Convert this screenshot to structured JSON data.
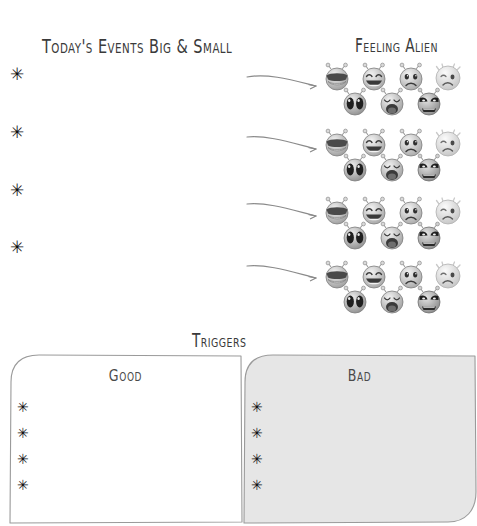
{
  "page": {
    "background_color": "#ffffff",
    "ink_color": "#2b2b2b"
  },
  "events_section": {
    "title": "Today's Events Big & Small",
    "bullet_glyph": "✳",
    "bullets": [
      {
        "marker": "✳",
        "value": ""
      },
      {
        "marker": "✳",
        "value": ""
      },
      {
        "marker": "✳",
        "value": ""
      },
      {
        "marker": "✳",
        "value": ""
      }
    ]
  },
  "alien_section": {
    "title": "Feeling alien",
    "arrow_count": 4,
    "groups": [
      {
        "label": "mood-row-1",
        "faces": [
          {
            "name": "cool-sunglasses-alien-face",
            "mood": "cool"
          },
          {
            "name": "laughing-alien-face",
            "mood": "laughing"
          },
          {
            "name": "sad-alien-face",
            "mood": "sad"
          },
          {
            "name": "sick-alien-face",
            "mood": "sick"
          },
          {
            "name": "shocked-alien-face",
            "mood": "shocked"
          },
          {
            "name": "crying-alien-face",
            "mood": "crying"
          },
          {
            "name": "angry-alien-face",
            "mood": "angry"
          }
        ]
      },
      {
        "label": "mood-row-2",
        "faces": [
          {
            "name": "cool-sunglasses-alien-face",
            "mood": "cool"
          },
          {
            "name": "laughing-alien-face",
            "mood": "laughing"
          },
          {
            "name": "sad-alien-face",
            "mood": "sad"
          },
          {
            "name": "sick-alien-face",
            "mood": "sick"
          },
          {
            "name": "shocked-alien-face",
            "mood": "shocked"
          },
          {
            "name": "crying-alien-face",
            "mood": "crying"
          },
          {
            "name": "angry-alien-face",
            "mood": "angry"
          }
        ]
      },
      {
        "label": "mood-row-3",
        "faces": [
          {
            "name": "cool-sunglasses-alien-face",
            "mood": "cool"
          },
          {
            "name": "laughing-alien-face",
            "mood": "laughing"
          },
          {
            "name": "sad-alien-face",
            "mood": "sad"
          },
          {
            "name": "sick-alien-face",
            "mood": "sick"
          },
          {
            "name": "shocked-alien-face",
            "mood": "shocked"
          },
          {
            "name": "crying-alien-face",
            "mood": "crying"
          },
          {
            "name": "angry-alien-face",
            "mood": "angry"
          }
        ]
      },
      {
        "label": "mood-row-4",
        "faces": [
          {
            "name": "cool-sunglasses-alien-face",
            "mood": "cool"
          },
          {
            "name": "laughing-alien-face",
            "mood": "laughing"
          },
          {
            "name": "sad-alien-face",
            "mood": "sad"
          },
          {
            "name": "sick-alien-face",
            "mood": "sick"
          },
          {
            "name": "shocked-alien-face",
            "mood": "shocked"
          },
          {
            "name": "crying-alien-face",
            "mood": "crying"
          },
          {
            "name": "angry-alien-face",
            "mood": "angry"
          }
        ]
      }
    ]
  },
  "triggers_section": {
    "title": "Triggers",
    "boxes": [
      {
        "label": "Good",
        "fill_color": "#ffffff",
        "border_color": "#9a9a9a",
        "bullets": [
          {
            "marker": "✳",
            "value": ""
          },
          {
            "marker": "✳",
            "value": ""
          },
          {
            "marker": "✳",
            "value": ""
          },
          {
            "marker": "✳",
            "value": ""
          }
        ]
      },
      {
        "label": "Bad",
        "fill_color": "#e6e6e6",
        "border_color": "#9a9a9a",
        "bullets": [
          {
            "marker": "✳",
            "value": ""
          },
          {
            "marker": "✳",
            "value": ""
          },
          {
            "marker": "✳",
            "value": ""
          },
          {
            "marker": "✳",
            "value": ""
          }
        ]
      }
    ]
  }
}
